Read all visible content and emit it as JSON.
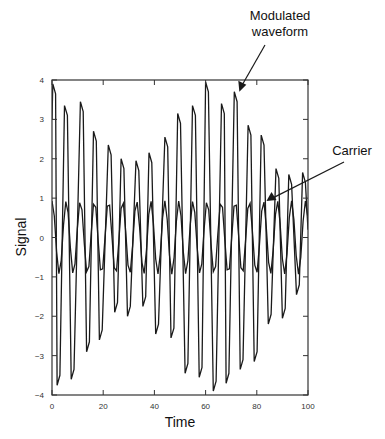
{
  "chart_data": {
    "type": "line",
    "title": "",
    "xlabel": "Time",
    "ylabel": "Signal",
    "xlim": [
      0,
      100
    ],
    "ylim": [
      -4,
      4
    ],
    "grid": false,
    "legend": null,
    "x_ticks": [
      0,
      20,
      40,
      60,
      80,
      100
    ],
    "x_tick_labels": [
      "0",
      "20",
      "40",
      "60",
      "80",
      "100"
    ],
    "y_ticks": [
      4,
      3,
      2,
      1,
      0,
      -1,
      -2,
      -3,
      -4
    ],
    "y_tick_labels": [
      "4",
      "3",
      "2",
      "1",
      "0",
      "−1",
      "−2",
      "−3",
      "−4"
    ],
    "annotations": [
      {
        "text_lines": [
          "Modulated",
          "waveform"
        ],
        "points_to": "modulated",
        "target": [
          72,
          3.7
        ]
      },
      {
        "text_lines": [
          "Carrier"
        ],
        "points_to": "carrier",
        "target": [
          83,
          0.95
        ]
      }
    ],
    "series": [
      {
        "name": "Carrier",
        "description": "sinusoid amplitude ~1, period ~5.5 time units",
        "amplitude": 1.0,
        "period": 5.5,
        "sample_step": 1
      },
      {
        "name": "Modulated waveform",
        "peaks": [
          {
            "t": 0.8,
            "v": 3.9
          },
          {
            "t": 5.4,
            "v": 3.35
          },
          {
            "t": 11.6,
            "v": 3.45
          },
          {
            "t": 16.7,
            "v": 2.7
          },
          {
            "t": 22.5,
            "v": 2.35
          },
          {
            "t": 27.5,
            "v": 2.0
          },
          {
            "t": 33.3,
            "v": 1.95
          },
          {
            "t": 38.4,
            "v": 2.15
          },
          {
            "t": 44.6,
            "v": 2.55
          },
          {
            "t": 49.6,
            "v": 3.15
          },
          {
            "t": 55.4,
            "v": 3.35
          },
          {
            "t": 60.5,
            "v": 3.95
          },
          {
            "t": 66.7,
            "v": 3.4
          },
          {
            "t": 71.7,
            "v": 3.7
          },
          {
            "t": 77.1,
            "v": 2.85
          },
          {
            "t": 82.2,
            "v": 2.6
          },
          {
            "t": 88.0,
            "v": 1.75
          },
          {
            "t": 93.0,
            "v": 1.6
          },
          {
            "t": 98.4,
            "v": 1.65
          }
        ],
        "troughs": [
          {
            "t": 2.5,
            "v": -3.75
          },
          {
            "t": 8.0,
            "v": -3.6
          },
          {
            "t": 14.0,
            "v": -2.9
          },
          {
            "t": 19.0,
            "v": -2.6
          },
          {
            "t": 25.0,
            "v": -1.9
          },
          {
            "t": 30.0,
            "v": -2.0
          },
          {
            "t": 36.0,
            "v": -1.75
          },
          {
            "t": 41.0,
            "v": -2.45
          },
          {
            "t": 47.0,
            "v": -2.55
          },
          {
            "t": 52.5,
            "v": -3.45
          },
          {
            "t": 58.0,
            "v": -3.55
          },
          {
            "t": 63.5,
            "v": -3.9
          },
          {
            "t": 68.5,
            "v": -3.7
          },
          {
            "t": 74.0,
            "v": -3.35
          },
          {
            "t": 79.5,
            "v": -3.15
          },
          {
            "t": 85.0,
            "v": -2.2
          },
          {
            "t": 90.5,
            "v": -2.05
          },
          {
            "t": 96.0,
            "v": -1.45
          }
        ]
      }
    ]
  },
  "colors": {
    "line": "#1a1a1a",
    "axis": "#333333",
    "background": "#ffffff"
  }
}
